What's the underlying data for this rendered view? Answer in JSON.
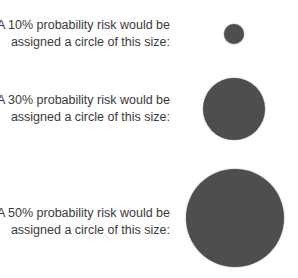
{
  "legend": {
    "items": [
      {
        "line1": "A 10% probability risk would be",
        "line2": "assigned a circle of this size:",
        "probability": 10,
        "diameter": 20,
        "color": "#4e4e4e"
      },
      {
        "line1": "A 30% probability risk would be",
        "line2": "assigned a circle of this size:",
        "probability": 30,
        "diameter": 62,
        "color": "#4e4e4e"
      },
      {
        "line1": "A 50% probability risk would be",
        "line2": "assigned a circle of this size:",
        "probability": 50,
        "diameter": 98,
        "color": "#4e4e4e"
      }
    ]
  }
}
